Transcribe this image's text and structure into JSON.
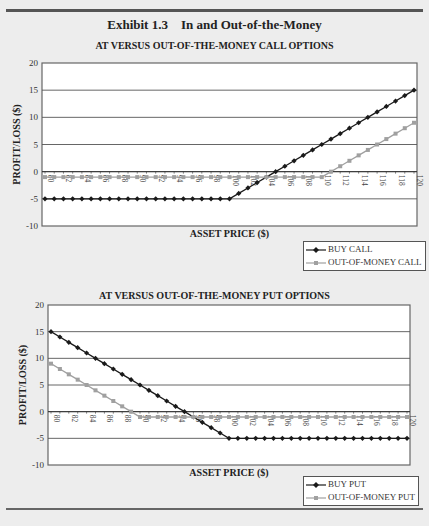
{
  "exhibit": {
    "title": "Exhibit 1.3    In and Out-of-the-Money"
  },
  "charts": {
    "call": {
      "title": "AT VERSUS OUT-OF-THE-MONEY CALL OPTIONS",
      "ylabel": "PROFIT/LOSS ($)",
      "xlabel": "ASSET PRICE ($)",
      "legend": [
        "BUY CALL",
        "OUT-OF-MONEY CALL"
      ]
    },
    "put": {
      "title": "AT VERSUS OUT-OF-THE-MONEY PUT OPTIONS",
      "ylabel": "PROFIT/LOSS ($)",
      "xlabel": "ASSET PRICE ($)",
      "legend": [
        "BUY PUT",
        "OUT-OF-MONEY PUT"
      ]
    }
  },
  "colors": {
    "series_dark": "#1a1a1a",
    "series_light": "#a0a0a0",
    "grid": "#555555",
    "plot_bg": "#ffffff"
  },
  "chart_data": [
    {
      "type": "line",
      "title": "AT VERSUS OUT-OF-THE-MONEY CALL OPTIONS",
      "xlabel": "ASSET PRICE ($)",
      "ylabel": "PROFIT/LOSS ($)",
      "ylim": [
        -10,
        20
      ],
      "yticks": [
        -10,
        -5,
        0,
        5,
        10,
        15,
        20
      ],
      "xlim": [
        80,
        120
      ],
      "xtick_labels": [
        "80",
        "82",
        "84",
        "86",
        "88",
        "90",
        "92",
        "94",
        "96",
        "98",
        "100",
        "102",
        "104",
        "106",
        "108",
        "110",
        "112",
        "114",
        "116",
        "118",
        "120"
      ],
      "grid": true,
      "legend_position": "bottom-right",
      "x": [
        80,
        81,
        82,
        83,
        84,
        85,
        86,
        87,
        88,
        89,
        90,
        91,
        92,
        93,
        94,
        95,
        96,
        97,
        98,
        99,
        100,
        101,
        102,
        103,
        104,
        105,
        106,
        107,
        108,
        109,
        110,
        111,
        112,
        113,
        114,
        115,
        116,
        117,
        118,
        119,
        120
      ],
      "series": [
        {
          "name": "BUY CALL",
          "marker": "diamond",
          "color": "#1a1a1a",
          "values": [
            -5,
            -5,
            -5,
            -5,
            -5,
            -5,
            -5,
            -5,
            -5,
            -5,
            -5,
            -5,
            -5,
            -5,
            -5,
            -5,
            -5,
            -5,
            -5,
            -5,
            -5,
            -4,
            -3,
            -2,
            -1,
            0,
            1,
            2,
            3,
            4,
            5,
            6,
            7,
            8,
            9,
            10,
            11,
            12,
            13,
            14,
            15
          ]
        },
        {
          "name": "OUT-OF-MONEY CALL",
          "marker": "square",
          "color": "#a0a0a0",
          "values": [
            -1,
            -1,
            -1,
            -1,
            -1,
            -1,
            -1,
            -1,
            -1,
            -1,
            -1,
            -1,
            -1,
            -1,
            -1,
            -1,
            -1,
            -1,
            -1,
            -1,
            -1,
            -1,
            -1,
            -1,
            -1,
            -1,
            -1,
            -1,
            -1,
            -1,
            -1,
            0,
            1,
            2,
            3,
            4,
            5,
            6,
            7,
            8,
            9
          ]
        }
      ]
    },
    {
      "type": "line",
      "title": "AT VERSUS OUT-OF-THE-MONEY PUT OPTIONS",
      "xlabel": "ASSET PRICE ($)",
      "ylabel": "PROFIT/LOSS ($)",
      "ylim": [
        -10,
        20
      ],
      "yticks": [
        -10,
        -5,
        0,
        5,
        10,
        15,
        20
      ],
      "xlim": [
        80,
        120
      ],
      "xtick_labels": [
        "80",
        "82",
        "84",
        "86",
        "88",
        "90",
        "92",
        "94",
        "96",
        "98",
        "100",
        "102",
        "104",
        "106",
        "108",
        "110",
        "112",
        "114",
        "116",
        "118",
        "120"
      ],
      "grid": true,
      "legend_position": "bottom-right",
      "x": [
        80,
        81,
        82,
        83,
        84,
        85,
        86,
        87,
        88,
        89,
        90,
        91,
        92,
        93,
        94,
        95,
        96,
        97,
        98,
        99,
        100,
        101,
        102,
        103,
        104,
        105,
        106,
        107,
        108,
        109,
        110,
        111,
        112,
        113,
        114,
        115,
        116,
        117,
        118,
        119,
        120
      ],
      "series": [
        {
          "name": "BUY PUT",
          "marker": "diamond",
          "color": "#1a1a1a",
          "values": [
            15,
            14,
            13,
            12,
            11,
            10,
            9,
            8,
            7,
            6,
            5,
            4,
            3,
            2,
            1,
            0,
            -1,
            -2,
            -3,
            -4,
            -5,
            -5,
            -5,
            -5,
            -5,
            -5,
            -5,
            -5,
            -5,
            -5,
            -5,
            -5,
            -5,
            -5,
            -5,
            -5,
            -5,
            -5,
            -5,
            -5,
            -5
          ]
        },
        {
          "name": "OUT-OF-MONEY PUT",
          "marker": "square",
          "color": "#a0a0a0",
          "values": [
            9,
            8,
            7,
            6,
            5,
            4,
            3,
            2,
            1,
            0,
            -1,
            -1,
            -1,
            -1,
            -1,
            -1,
            -1,
            -1,
            -1,
            -1,
            -1,
            -1,
            -1,
            -1,
            -1,
            -1,
            -1,
            -1,
            -1,
            -1,
            -1,
            -1,
            -1,
            -1,
            -1,
            -1,
            -1,
            -1,
            -1,
            -1,
            -1
          ]
        }
      ]
    }
  ]
}
